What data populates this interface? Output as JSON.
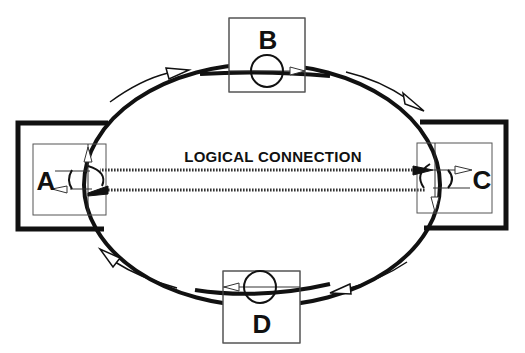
{
  "diagram": {
    "title": "LOGICAL CONNECTION",
    "nodes": [
      {
        "id": "A",
        "label": "A",
        "position": "left"
      },
      {
        "id": "B",
        "label": "B",
        "position": "top"
      },
      {
        "id": "C",
        "label": "C",
        "position": "right"
      },
      {
        "id": "D",
        "label": "D",
        "position": "bottom"
      }
    ],
    "ring": {
      "shape": "ellipse",
      "direction": "clockwise"
    },
    "logical_connection": {
      "from": "A",
      "to": "C",
      "style": "dotted-double-line"
    },
    "flow_arrows": [
      {
        "location": "top-left",
        "direction": "right"
      },
      {
        "location": "top-right",
        "direction": "down-right"
      },
      {
        "location": "bottom-right",
        "direction": "left"
      },
      {
        "location": "bottom-left",
        "direction": "up-left"
      }
    ],
    "colors": {
      "line": "#111111",
      "thin_line": "#555555",
      "background": "#ffffff"
    }
  }
}
